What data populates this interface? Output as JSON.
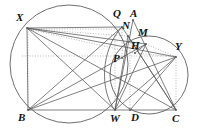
{
  "figure": {
    "kind": "euclidean-geometry-diagram",
    "width": 199,
    "height": 140,
    "background_color": "#ffffff",
    "stroke_color": "#555555",
    "dotted_color": "#9a9a9a",
    "label_color": "#111111"
  },
  "points": [
    {
      "id": "X",
      "label": "X",
      "x": 27,
      "y": 28,
      "label_x": 16,
      "label_y": 12
    },
    {
      "id": "Q",
      "label": "Q",
      "x": 122,
      "y": 27,
      "label_x": 113,
      "label_y": 8
    },
    {
      "id": "A",
      "label": "A",
      "x": 133,
      "y": 20,
      "label_x": 130,
      "label_y": 8
    },
    {
      "id": "N",
      "label": "N",
      "x": 128,
      "y": 36,
      "label_x": 122,
      "label_y": 20
    },
    {
      "id": "M",
      "label": "M",
      "x": 146,
      "y": 44,
      "label_x": 138,
      "label_y": 27
    },
    {
      "id": "H",
      "label": "H",
      "x": 135,
      "y": 53,
      "label_x": 131,
      "label_y": 40
    },
    {
      "id": "Y",
      "label": "Y",
      "x": 176,
      "y": 57,
      "label_x": 175,
      "label_y": 41
    },
    {
      "id": "P",
      "label": "P",
      "x": 122,
      "y": 58,
      "label_x": 113,
      "label_y": 53
    },
    {
      "id": "B",
      "label": "B",
      "x": 28,
      "y": 110,
      "label_x": 18,
      "label_y": 112
    },
    {
      "id": "W",
      "label": "W",
      "x": 115,
      "y": 110,
      "label_x": 110,
      "label_y": 113
    },
    {
      "id": "D",
      "label": "D",
      "x": 130,
      "y": 110,
      "label_x": 131,
      "label_y": 112
    },
    {
      "id": "C",
      "label": "C",
      "x": 176,
      "y": 110,
      "label_x": 172,
      "label_y": 113
    }
  ],
  "circles": [
    {
      "id": "big-circle",
      "cx": 69,
      "cy": 64,
      "r": 59
    },
    {
      "id": "small-circle",
      "cx": 149,
      "cy": 75,
      "r": 39
    }
  ],
  "arcs": [
    {
      "id": "arc-w-q",
      "d": "M 115 110 C 100 92 100 50 122 27"
    }
  ],
  "solid_segments": [
    {
      "id": "seg-B-C",
      "x1": 28,
      "y1": 110,
      "x2": 176,
      "y2": 110
    },
    {
      "id": "seg-B-X",
      "x1": 28,
      "y1": 110,
      "x2": 27,
      "y2": 28
    },
    {
      "id": "seg-B-Q",
      "x1": 28,
      "y1": 110,
      "x2": 122,
      "y2": 27
    },
    {
      "id": "seg-B-M",
      "x1": 28,
      "y1": 110,
      "x2": 146,
      "y2": 44
    },
    {
      "id": "seg-B-Y",
      "x1": 28,
      "y1": 110,
      "x2": 176,
      "y2": 57
    },
    {
      "id": "seg-X-C",
      "x1": 27,
      "y1": 28,
      "x2": 176,
      "y2": 110
    },
    {
      "id": "seg-X-W",
      "x1": 27,
      "y1": 28,
      "x2": 115,
      "y2": 110
    },
    {
      "id": "seg-X-Q",
      "x1": 27,
      "y1": 28,
      "x2": 122,
      "y2": 27
    },
    {
      "id": "seg-X-M",
      "x1": 27,
      "y1": 28,
      "x2": 146,
      "y2": 44
    },
    {
      "id": "seg-X-Y",
      "x1": 27,
      "y1": 28,
      "x2": 176,
      "y2": 57
    },
    {
      "id": "seg-W-A",
      "x1": 115,
      "y1": 110,
      "x2": 133,
      "y2": 20
    },
    {
      "id": "seg-W-M",
      "x1": 115,
      "y1": 110,
      "x2": 146,
      "y2": 44
    },
    {
      "id": "seg-W-Y",
      "x1": 115,
      "y1": 110,
      "x2": 176,
      "y2": 57
    },
    {
      "id": "seg-W-N",
      "x1": 115,
      "y1": 110,
      "x2": 128,
      "y2": 36
    },
    {
      "id": "seg-C-A",
      "x1": 176,
      "y1": 110,
      "x2": 133,
      "y2": 20
    },
    {
      "id": "seg-C-N",
      "x1": 176,
      "y1": 110,
      "x2": 128,
      "y2": 36
    },
    {
      "id": "seg-C-Q",
      "x1": 176,
      "y1": 110,
      "x2": 122,
      "y2": 27
    },
    {
      "id": "seg-Y-D",
      "x1": 176,
      "y1": 57,
      "x2": 130,
      "y2": 110
    },
    {
      "id": "seg-M-H",
      "x1": 146,
      "y1": 44,
      "x2": 135,
      "y2": 53
    }
  ],
  "dotted_segments": [
    {
      "id": "dot-X-Q-horizontal",
      "x1": 28,
      "y1": 29,
      "x2": 124,
      "y2": 29
    },
    {
      "id": "dot-X-N",
      "x1": 28,
      "y1": 29,
      "x2": 128,
      "y2": 36
    },
    {
      "id": "dot-X-H",
      "x1": 28,
      "y1": 29,
      "x2": 135,
      "y2": 53
    },
    {
      "id": "dot-mid-horizontal",
      "x1": 22,
      "y1": 56,
      "x2": 178,
      "y2": 56
    },
    {
      "id": "dot-H-Y",
      "x1": 135,
      "y1": 53,
      "x2": 176,
      "y2": 57
    },
    {
      "id": "dot-M-Y",
      "x1": 146,
      "y1": 44,
      "x2": 176,
      "y2": 57
    },
    {
      "id": "dot-vert-W",
      "x1": 115,
      "y1": 36,
      "x2": 115,
      "y2": 110
    },
    {
      "id": "dot-vert-D",
      "x1": 130,
      "y1": 29,
      "x2": 130,
      "y2": 110
    },
    {
      "id": "dot-vert-Y",
      "x1": 176,
      "y1": 57,
      "x2": 176,
      "y2": 110
    },
    {
      "id": "dot-vert-B",
      "x1": 28,
      "y1": 29,
      "x2": 28,
      "y2": 110
    },
    {
      "id": "dot-Q-vert",
      "x1": 122,
      "y1": 27,
      "x2": 122,
      "y2": 58
    },
    {
      "id": "dot-N-H",
      "x1": 128,
      "y1": 36,
      "x2": 135,
      "y2": 53
    }
  ]
}
